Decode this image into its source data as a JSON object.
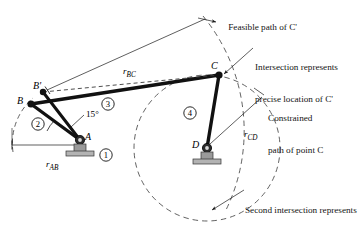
{
  "figure": {
    "type": "fourbar-linkage-geometry-diagram",
    "background_color": "#ffffff",
    "line_color": "#000000",
    "dashed_color": "#3a3a3a"
  },
  "annotations": {
    "feasible_path": "Feasible path of C'",
    "intersection_line1": "Intersection represents",
    "intersection_line2": "precise location of C'",
    "constrained_line1": "Constrained",
    "constrained_line2": "path of point C",
    "second_line1": "Second intersection represents",
    "second_line2": "another geometric",
    "second_line3": "inversion"
  },
  "points": [
    {
      "id": "A",
      "label": "A",
      "x": 80,
      "y": 140,
      "kind": "ground-pivot"
    },
    {
      "id": "B",
      "label": "B",
      "x": 31,
      "y": 104,
      "kind": "moving-pivot"
    },
    {
      "id": "Bprime",
      "label": "B'",
      "x": 43,
      "y": 92,
      "kind": "moving-pivot"
    },
    {
      "id": "C",
      "label": "C",
      "x": 219,
      "y": 75,
      "kind": "moving-pivot"
    },
    {
      "id": "D",
      "label": "D",
      "x": 207,
      "y": 148,
      "kind": "ground-pivot"
    }
  ],
  "dimensions": [
    {
      "id": "rAB",
      "symbol": "r",
      "subscript": "AB",
      "from": "A",
      "to": "B"
    },
    {
      "id": "rBC",
      "symbol": "r",
      "subscript": "BC",
      "from": "B'",
      "to": "feasible-arc"
    },
    {
      "id": "rCD",
      "symbol": "r",
      "subscript": "CD",
      "from": "D",
      "to": "constrained-arc"
    }
  ],
  "angle": {
    "value": "15°",
    "at": "A",
    "between": [
      "AB",
      "AB'"
    ]
  },
  "links": [
    {
      "number": "1",
      "glyph": "①",
      "name": "ground-link",
      "x": 106,
      "y": 155
    },
    {
      "number": "2",
      "glyph": "②",
      "name": "input-crank",
      "x": 38,
      "y": 124
    },
    {
      "number": "3",
      "glyph": "③",
      "name": "coupler",
      "x": 108,
      "y": 104
    },
    {
      "number": "4",
      "glyph": "④",
      "name": "output-rocker",
      "x": 190,
      "y": 113
    }
  ],
  "arcs": [
    {
      "id": "path-of-B",
      "center": "A",
      "radius": 60,
      "style": "dashed"
    },
    {
      "id": "constrained-path",
      "center": "D",
      "radius": 73,
      "style": "dashed"
    },
    {
      "id": "feasible-path",
      "center": "B'",
      "radius": 181,
      "style": "dashed"
    }
  ]
}
